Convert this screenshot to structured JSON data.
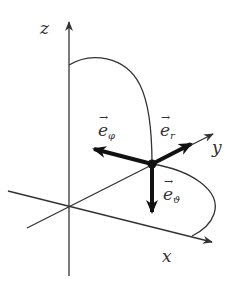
{
  "diagram": {
    "axes": {
      "x": {
        "label": "x"
      },
      "y": {
        "label": "y"
      },
      "z": {
        "label": "z"
      }
    },
    "vectors": [
      {
        "name": "e_r",
        "base": "e",
        "sub": "r"
      },
      {
        "name": "e_phi",
        "base": "e",
        "sub": "φ"
      },
      {
        "name": "e_theta",
        "base": "e",
        "sub": "ϑ"
      }
    ],
    "colors": {
      "line": "#333333",
      "vector": "#111111",
      "background": "#ffffff"
    }
  }
}
